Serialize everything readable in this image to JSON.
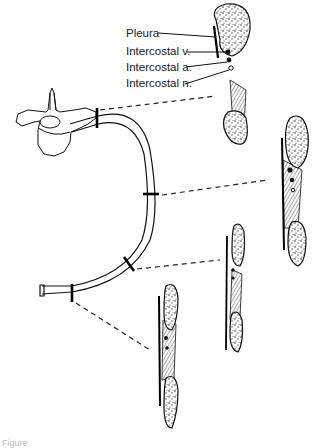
{
  "figure": {
    "type": "anatomical-diagram",
    "labels": [
      {
        "id": "pleura",
        "text": "Pleura"
      },
      {
        "id": "intercostal-v",
        "text": "Intercostal v."
      },
      {
        "id": "intercostal-a",
        "text": "Intercostal a."
      },
      {
        "id": "intercostal-n",
        "text": "Intercostal n."
      }
    ],
    "caption": "Figure",
    "cross_sections": [
      {
        "id": "section-1",
        "location": "posterior, near vertebra"
      },
      {
        "id": "section-2",
        "location": "posterior angle"
      },
      {
        "id": "section-3",
        "location": "lateral"
      },
      {
        "id": "section-4",
        "location": "anterior, near costal cartilage"
      }
    ],
    "colors": {
      "line": "#111111",
      "background": "#ffffff"
    }
  }
}
